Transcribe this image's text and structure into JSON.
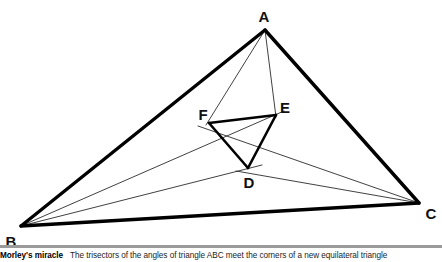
{
  "figure": {
    "title": "Morley's miracle",
    "caption": "The trisectors of the angles of triangle ABC meet the corners of a new equilateral triangle",
    "stroke_color": "#000000",
    "thin_stroke_color": "#2b2b2b",
    "rule_color": "#9a9a9a",
    "background": "#ffffff"
  },
  "diagram": {
    "type": "geometry",
    "name": "morleys-trisector-triangle",
    "outer_triangle": {
      "label": "ABC",
      "vertices": [
        {
          "id": "A",
          "label": "A",
          "x": 265,
          "y": 30,
          "label_x": 264,
          "label_y": 22
        },
        {
          "id": "B",
          "label": "B",
          "x": 21,
          "y": 226,
          "label_x": 11,
          "label_y": 247
        },
        {
          "id": "C",
          "label": "C",
          "x": 419,
          "y": 203,
          "label_x": 431,
          "label_y": 219
        }
      ],
      "edges": [
        {
          "from": "A",
          "to": "B"
        },
        {
          "from": "B",
          "to": "C"
        },
        {
          "from": "C",
          "to": "A"
        }
      ]
    },
    "inner_triangle": {
      "label": "DEF",
      "vertices": [
        {
          "id": "D",
          "label": "D",
          "x": 248,
          "y": 168,
          "label_x": 249,
          "label_y": 188
        },
        {
          "id": "E",
          "label": "E",
          "x": 276,
          "y": 115,
          "label_x": 285,
          "label_y": 113
        },
        {
          "id": "F",
          "label": "F",
          "x": 209,
          "y": 123,
          "label_x": 203,
          "label_y": 120
        }
      ],
      "edges": [
        {
          "from": "D",
          "to": "E"
        },
        {
          "from": "E",
          "to": "F"
        },
        {
          "from": "F",
          "to": "D"
        }
      ]
    },
    "trisectors": [
      {
        "from": "A",
        "to": "F",
        "x1": 265,
        "y1": 30,
        "x2": 209,
        "y2": 123
      },
      {
        "from": "A",
        "to": "E",
        "x1": 265,
        "y1": 30,
        "x2": 276,
        "y2": 115
      },
      {
        "from": "B",
        "to": "E",
        "x1": 21,
        "y1": 226,
        "x2": 276,
        "y2": 115
      },
      {
        "from": "B",
        "to": "D",
        "x1": 21,
        "y1": 226,
        "x2": 248,
        "y2": 168
      },
      {
        "from": "C",
        "to": "F",
        "x1": 419,
        "y1": 203,
        "x2": 209,
        "y2": 123
      },
      {
        "from": "C",
        "to": "D",
        "x1": 419,
        "y1": 203,
        "x2": 248,
        "y2": 168
      }
    ],
    "trisector_extensions": [
      {
        "from": "B",
        "through": "E",
        "x1": 21,
        "y1": 226,
        "x2": 283,
        "y2": 112
      },
      {
        "from": "B",
        "through": "D",
        "x1": 21,
        "y1": 226,
        "x2": 256,
        "y2": 166
      },
      {
        "from": "C",
        "through": "F",
        "x1": 419,
        "y1": 203,
        "x2": 200,
        "y2": 126
      },
      {
        "from": "C",
        "through": "D",
        "x1": 419,
        "y1": 203,
        "x2": 240,
        "y2": 170
      }
    ]
  }
}
